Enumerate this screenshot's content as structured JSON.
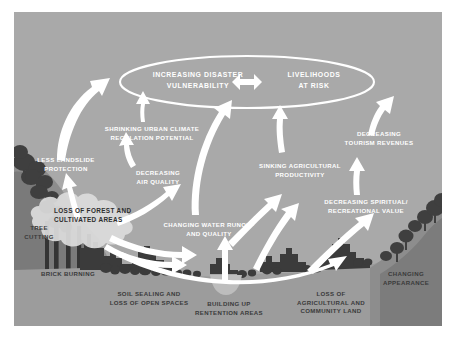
{
  "diagram": {
    "title_central": {
      "left_text": "INCREASING DISASTER\nVULNERABILITY",
      "right_text": "LIVELIHOODS\nAT RISK"
    },
    "colors": {
      "background": "#a9a9a9",
      "panel_border": "#ffffff",
      "arrow": "#ffffff",
      "text_light": "#ffffff",
      "text_dark": "#3a3a3a",
      "silhouette_dark": "#3b3b3b",
      "silhouette_mid": "#6e6e6e",
      "cloud_fill": "#d4d4d4"
    },
    "nodes": [
      {
        "id": "less-landslide-protection",
        "label": "LESS LANDSLIDE\nPROTECTION",
        "tone": "light"
      },
      {
        "id": "tree-cutting",
        "label": "TREE\nCUTTING",
        "tone": "dark"
      },
      {
        "id": "brick-burning",
        "label": "BRICK BURNING",
        "tone": "dark"
      },
      {
        "id": "loss-of-forest-and-cultivated-areas",
        "label": "LOSS OF FOREST AND\nCULTIVATED AREAS",
        "tone": "cloud"
      },
      {
        "id": "shrinking-urban-climate-regulation-potential",
        "label": "SHRINKING URBAN CLIMATE\nREGULATION POTENTIAL",
        "tone": "light"
      },
      {
        "id": "decreasing-air-quality",
        "label": "DECREASING\nAIR QUALITY",
        "tone": "light"
      },
      {
        "id": "soil-sealing-and-loss-of-open-spaces",
        "label": "SOIL SEALING AND\nLOSS OF OPEN SPACES",
        "tone": "dark"
      },
      {
        "id": "changing-water-runoff-and-quality",
        "label": "CHANGING WATER RUNOFF\nAND QUALITY",
        "tone": "light"
      },
      {
        "id": "building-up-rentention-areas",
        "label": "BUILDING UP\nRENTENTION AREAS",
        "tone": "dark"
      },
      {
        "id": "sinking-agricultural-productivity",
        "label": "SINKING AGRICULTURAL\nPRODUCTIVITY",
        "tone": "light"
      },
      {
        "id": "loss-of-agricultural-and-community-land",
        "label": "LOSS OF\nAGRICULTURAL AND\nCOMMUNITY LAND",
        "tone": "dark"
      },
      {
        "id": "decreasing-spiritual-recreational-value",
        "label": "DECREASING  SPIRITUAL/\nRECREATIONAL VALUE",
        "tone": "light"
      },
      {
        "id": "decreasing-tourism-revenues",
        "label": "DECREASING\nTOURISM REVENUES",
        "tone": "light"
      },
      {
        "id": "changing-appearance",
        "label": "CHANGING\nAPPEARANCE",
        "tone": "dark"
      }
    ]
  }
}
